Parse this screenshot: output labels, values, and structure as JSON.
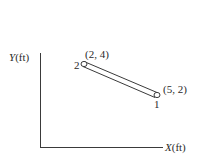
{
  "diagram": {
    "axes": {
      "y_label_var": "Y",
      "y_label_unit": "(ft)",
      "x_label_var": "X",
      "x_label_unit": "(ft)"
    },
    "member": {
      "node_start": {
        "id": "2",
        "coords": "(2, 4)"
      },
      "node_end": {
        "id": "1",
        "coords": "(5, 2)"
      }
    },
    "colors": {
      "line": "#3a3a3a",
      "background": "#ffffff"
    }
  }
}
